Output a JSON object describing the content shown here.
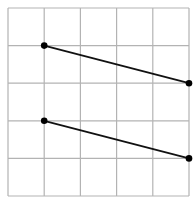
{
  "diagram": {
    "type": "grid-with-segments",
    "grid": {
      "cols": 5,
      "rows": 5,
      "origin_px": [
        8,
        8
      ],
      "cell_w": 36.2,
      "cell_h": 37.6,
      "line_color": "#b3b3b3"
    },
    "segments": [
      {
        "from": [
          1,
          1
        ],
        "to": [
          5,
          2
        ]
      },
      {
        "from": [
          1,
          3
        ],
        "to": [
          5,
          4
        ]
      }
    ],
    "segment_color": "#111111",
    "point_color": "#000000"
  }
}
